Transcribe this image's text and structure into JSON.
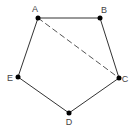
{
  "diagram": {
    "type": "pentagon",
    "colors": {
      "edge": "#333333",
      "diagonal": "#555555",
      "vertex": "#000000",
      "label": "#444444"
    },
    "vertices": [
      {
        "id": "A",
        "label": "A",
        "x": 38,
        "y": 18,
        "lx": 35,
        "ly": 12
      },
      {
        "id": "B",
        "label": "B",
        "x": 100,
        "y": 18,
        "lx": 104,
        "ly": 13
      },
      {
        "id": "C",
        "label": "C",
        "x": 119,
        "y": 78,
        "lx": 125,
        "ly": 82
      },
      {
        "id": "D",
        "label": "D",
        "x": 69,
        "y": 113,
        "lx": 69,
        "ly": 125
      },
      {
        "id": "E",
        "label": "E",
        "x": 18,
        "y": 77,
        "lx": 10,
        "ly": 81
      }
    ],
    "edges": [
      {
        "from": "A",
        "to": "B",
        "style": "solid"
      },
      {
        "from": "B",
        "to": "C",
        "style": "solid"
      },
      {
        "from": "C",
        "to": "D",
        "style": "solid"
      },
      {
        "from": "D",
        "to": "E",
        "style": "solid"
      },
      {
        "from": "E",
        "to": "A",
        "style": "solid"
      },
      {
        "from": "A",
        "to": "C",
        "style": "dashed"
      }
    ]
  }
}
